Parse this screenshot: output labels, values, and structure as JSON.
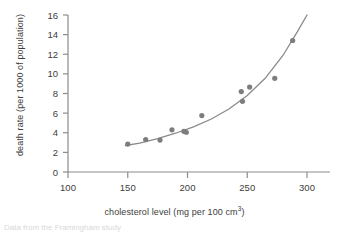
{
  "figure": {
    "footer_note": "Data from the Framingham study"
  },
  "chart_data": {
    "type": "scatter",
    "title": "",
    "xlabel": "cholesterol level (mg per 100 cm",
    "xlabel_superscript": "3",
    "xlabel_suffix": ")",
    "ylabel": "death rate (per 1000 of population)",
    "xlim": [
      100,
      310
    ],
    "ylim": [
      0,
      16
    ],
    "xticks": [
      100,
      150,
      200,
      250,
      300
    ],
    "yticks": [
      0,
      2,
      4,
      6,
      8,
      10,
      12,
      14,
      16
    ],
    "grid": false,
    "legend": "none",
    "marker_color": "#7d7d7d",
    "line_color": "#8a8a8a",
    "axis_color": "#8c8c8c",
    "series": [
      {
        "name": "observed death rate",
        "x": [
          150,
          165,
          177,
          187,
          197,
          199,
          212,
          245,
          246,
          252,
          273,
          288
        ],
        "y": [
          2.85,
          3.3,
          3.25,
          4.3,
          4.15,
          4.05,
          5.75,
          8.2,
          7.2,
          8.65,
          9.55,
          13.4
        ]
      },
      {
        "name": "fitted curve",
        "type": "line",
        "x": [
          148,
          160,
          175,
          190,
          205,
          220,
          235,
          250,
          265,
          280,
          292,
          300
        ],
        "y": [
          2.7,
          2.95,
          3.4,
          3.95,
          4.6,
          5.4,
          6.45,
          7.8,
          9.55,
          11.9,
          14.3,
          16.0
        ]
      }
    ]
  }
}
